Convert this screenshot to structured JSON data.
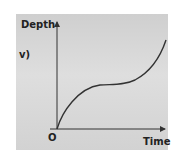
{
  "diagram": {
    "part_label": "v)",
    "y_axis_label": "Depth",
    "x_axis_label": "Time",
    "origin_label": "O",
    "curve_description": "Depth increases rapidly from origin, levels off to a plateau, then increases steeply again",
    "colors": {
      "background": "#d6d6d6",
      "line": "#333333",
      "text": "#222222"
    }
  }
}
